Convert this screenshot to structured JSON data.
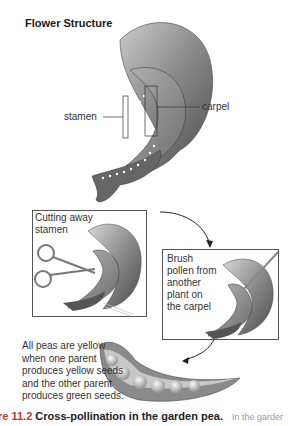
{
  "figure": {
    "title": "Flower Structure",
    "labels": {
      "stamen": "stamen",
      "carpel": "carpel"
    },
    "steps": [
      {
        "text": "Cutting away\nstamen",
        "lines": [
          "Cutting away",
          "stamen"
        ]
      },
      {
        "text": "Brush pollen from another plant on the carpel",
        "lines": [
          "Brush",
          "pollen from",
          "another",
          "plant on",
          "the carpel"
        ]
      }
    ],
    "result_text_lines": [
      "All peas are yellow",
      "when one parent",
      "produces yellow seeds",
      "and the other parent",
      "produces green seeds."
    ],
    "caption": {
      "number": "re 11.2",
      "title": "Cross-pollination in the garden pea.",
      "continuation": "In the garder"
    }
  }
}
